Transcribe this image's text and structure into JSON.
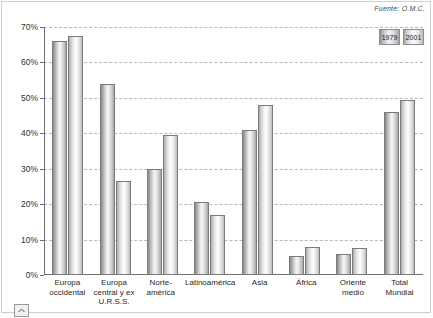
{
  "source_note": "Fuente: O.M.C.",
  "legend": {
    "items": [
      {
        "label": "1979",
        "series": "s1"
      },
      {
        "label": "2001",
        "series": "s2"
      }
    ]
  },
  "axis": {
    "y_ticks": [
      "0%",
      "10%",
      "20%",
      "30%",
      "40%",
      "50%",
      "60%",
      "70%"
    ]
  },
  "controls": {
    "scroll_up_icon": "chevron-up-icon"
  },
  "chart_data": {
    "type": "bar",
    "title": "",
    "subtitle": "",
    "xlabel": "",
    "ylabel": "",
    "ylim": [
      0,
      70
    ],
    "y_unit": "%",
    "grid": true,
    "legend_position": "top-right",
    "annotations": [
      "Fuente: O.M.C."
    ],
    "categories": [
      "Europa occidental",
      "Europa central y ex U.R.S.S.",
      "Norte-américa",
      "Latinoamérica",
      "Asia",
      "África",
      "Oriente medio",
      "Total Mundial"
    ],
    "series": [
      {
        "name": "1979",
        "values": [
          66.0,
          54.0,
          30.0,
          20.5,
          41.0,
          5.5,
          6.0,
          46.0
        ]
      },
      {
        "name": "2001",
        "values": [
          67.5,
          26.5,
          39.5,
          17.0,
          48.0,
          7.8,
          7.5,
          49.5
        ]
      }
    ]
  }
}
